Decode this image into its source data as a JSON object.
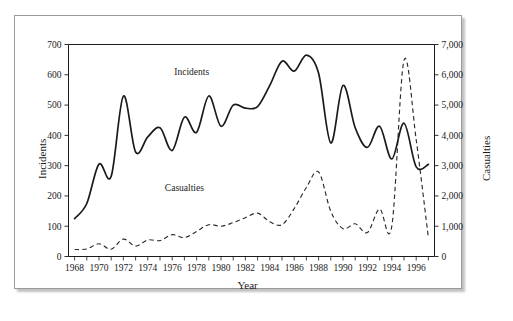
{
  "figure": {
    "background_color": "#ffffff",
    "frame_color": "#9a9a9a"
  },
  "chart_data": {
    "type": "line",
    "title": "",
    "xlabel": "Year",
    "ylabel": "Incidents",
    "ylabel_secondary": "Casualties",
    "grid": false,
    "legend_position": "inline-annotation",
    "x": [
      1968,
      1969,
      1970,
      1971,
      1972,
      1973,
      1974,
      1975,
      1976,
      1977,
      1978,
      1979,
      1980,
      1981,
      1982,
      1983,
      1984,
      1985,
      1986,
      1987,
      1988,
      1989,
      1990,
      1991,
      1992,
      1993,
      1994,
      1995,
      1996,
      1997
    ],
    "x_tick_labels": [
      "1968",
      "1970",
      "1972",
      "1974",
      "1976",
      "1978",
      "1980",
      "1982",
      "1984",
      "1986",
      "1988",
      "1990",
      "1992",
      "1994",
      "1996"
    ],
    "x_minor_ticks_every": 1,
    "xlim": [
      1967.5,
      1997.5
    ],
    "ylim": [
      0,
      700
    ],
    "y_ticks": [
      0,
      100,
      200,
      300,
      400,
      500,
      600,
      700
    ],
    "y_tick_labels": [
      "0",
      "100",
      "200",
      "300",
      "400",
      "500",
      "600",
      "700"
    ],
    "ylim_secondary": [
      0,
      7000
    ],
    "y_ticks_secondary": [
      0,
      1000,
      2000,
      3000,
      4000,
      5000,
      6000,
      7000
    ],
    "y_tick_labels_secondary": [
      "0",
      "1,000",
      "2,000",
      "3,000",
      "4,000",
      "5,000",
      "6,000",
      "7,000"
    ],
    "annotations": [
      {
        "text": "Incidents",
        "x": 1977.6,
        "y": 600
      },
      {
        "text": "Casualties",
        "x": 1977.0,
        "y": 215
      }
    ],
    "series": [
      {
        "name": "Incidents",
        "axis": "left",
        "style": "solid",
        "color": "#1a1a1a",
        "values": [
          125,
          175,
          305,
          265,
          530,
          345,
          395,
          425,
          350,
          460,
          410,
          530,
          430,
          500,
          490,
          495,
          565,
          645,
          612,
          665,
          605,
          375,
          565,
          425,
          360,
          430,
          322,
          440,
          296,
          304
        ]
      },
      {
        "name": "Casualties",
        "axis": "right",
        "style": "dashed",
        "color": "#2b2b2b",
        "values": [
          230,
          250,
          420,
          240,
          575,
          345,
          545,
          525,
          720,
          625,
          830,
          1050,
          1000,
          1120,
          1280,
          1430,
          1150,
          1050,
          1580,
          2280,
          2790,
          1490,
          920,
          1080,
          790,
          1570,
          1000,
          6480,
          3850,
          610
        ]
      }
    ]
  },
  "labels": {
    "incidents_axis_title": "Incidents",
    "casualties_axis_title": "Casualties",
    "x_axis_title": "Year",
    "incidents_series_label": "Incidents",
    "casualties_series_label": "Casualties"
  }
}
